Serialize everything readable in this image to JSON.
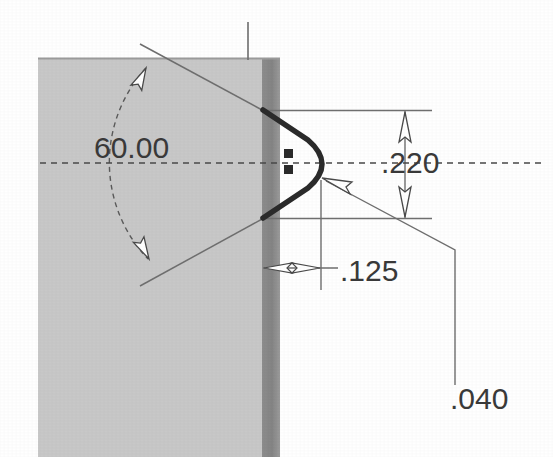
{
  "drawing": {
    "title": "Technical cross-section detail of V-notch in block",
    "background_color": "#ffffff",
    "block": {
      "name": "sectioned-block",
      "face_fill": "#c8c8c8",
      "edge_band_fill": "#8a8a8a",
      "top_edge_color": "#9a9a9a",
      "x": 38,
      "y": 58,
      "width": 224,
      "band_width": 18,
      "height": 399
    },
    "profile": {
      "name": "v-notch-profile",
      "stroke_color": "#2b2b2b",
      "stroke_width": 5,
      "upper_vertex": [
        263,
        110
      ],
      "lower_vertex": [
        263,
        218
      ],
      "apex_x": 321,
      "apex_top_y": 150,
      "apex_bottom_y": 180
    },
    "centerline": {
      "name": "horizontal-centerline",
      "y": 163,
      "x_start": 40,
      "x_end": 541,
      "color": "#4a4a4a",
      "dash": "6 5"
    },
    "vertical_axis": {
      "name": "vertical-axis-line",
      "x": 248,
      "y_start": 22,
      "y_end": 60,
      "color": "#6a6a6a"
    },
    "line_color": "#6f6f6f",
    "text_color": "#3a3a3a"
  },
  "dimensions": [
    {
      "id": "angle",
      "name": "angle-dimension-60",
      "label": "60.00",
      "value": 60.0,
      "unit": "degrees",
      "text_x": 94,
      "text_y": 158,
      "type": "angular",
      "arc": {
        "cx": 266,
        "cy": 164,
        "radius": 138,
        "start_angle_deg": -150,
        "end_angle_deg": -210
      },
      "leaders": [
        {
          "x1": 263,
          "y1": 112,
          "x2": 140,
          "y2": 44
        },
        {
          "x1": 263,
          "y1": 217,
          "x2": 140,
          "y2": 285
        }
      ],
      "arrowheads": [
        {
          "x": 146,
          "y": 70,
          "angle_deg": 28,
          "style": "hollow"
        },
        {
          "x": 148,
          "y": 258,
          "angle_deg": -28,
          "style": "hollow"
        }
      ]
    },
    {
      "id": "height",
      "name": "height-dimension-220",
      "label": ".220",
      "value": 0.22,
      "unit": "inch",
      "type": "linear-vertical",
      "text_x": 382,
      "text_y": 172,
      "dim_line_x": 405,
      "ext_top_y": 110,
      "ext_bottom_y": 218,
      "ext_line_x_start": 265,
      "ext_line_x_end": 432,
      "arrowheads": [
        {
          "x": 405,
          "y": 113,
          "direction": "up",
          "style": "hollow"
        },
        {
          "x": 405,
          "y": 215,
          "direction": "down",
          "style": "hollow"
        }
      ]
    },
    {
      "id": "depth",
      "name": "depth-dimension-125",
      "label": ".125",
      "value": 0.125,
      "unit": "inch",
      "type": "linear-horizontal",
      "text_x": 341,
      "text_y": 281,
      "dim_line_y": 268,
      "x_from": 263,
      "x_to": 321,
      "leader_x_end": 338,
      "ext_line_x": 321,
      "ext_line_y_start": 180,
      "ext_line_y_end": 288,
      "arrowheads": [
        {
          "x": 266,
          "y": 268,
          "direction": "left",
          "style": "hollow"
        },
        {
          "x": 318,
          "y": 268,
          "direction": "right",
          "style": "hollow"
        }
      ]
    },
    {
      "id": "radius",
      "name": "radius-dimension-040",
      "label": ".040",
      "value": 0.04,
      "unit": "inch",
      "type": "leader",
      "text_x": 452,
      "text_y": 409,
      "leader_points": [
        [
          322,
          178
        ],
        [
          455,
          250
        ],
        [
          455,
          385
        ]
      ],
      "arrowhead": {
        "x": 324,
        "y": 179,
        "angle_deg": 208,
        "style": "hollow"
      }
    }
  ],
  "markers": [
    {
      "name": "corner-marker-upper",
      "x": 284,
      "y": 152,
      "size": 8,
      "color": "#2b2b2b"
    },
    {
      "name": "corner-marker-lower",
      "x": 284,
      "y": 167,
      "size": 8,
      "color": "#2b2b2b"
    }
  ]
}
